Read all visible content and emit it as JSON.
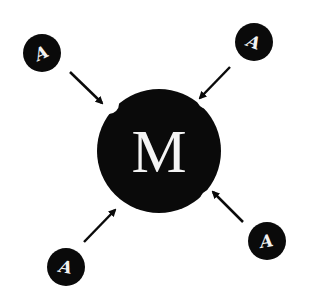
{
  "diagram": {
    "type": "hub-and-spoke",
    "colors": {
      "fill": "#0a0a0a",
      "text": "#f4f4f4",
      "background": "#ffffff"
    },
    "center": {
      "label": "M",
      "cx": 159,
      "cy": 151,
      "r": 62
    },
    "satellites": [
      {
        "id": "top-left",
        "label": "A",
        "cx": 42,
        "cy": 53,
        "rotate": -25
      },
      {
        "id": "top-right",
        "label": "A",
        "cx": 254,
        "cy": 42,
        "rotate": 20
      },
      {
        "id": "bottom-left",
        "label": "A",
        "cx": 66,
        "cy": 267,
        "rotate": 10
      },
      {
        "id": "bottom-right",
        "label": "A",
        "cx": 267,
        "cy": 241,
        "rotate": -10
      }
    ],
    "arrows": [
      {
        "from": "top-left",
        "to": "center",
        "x1": 70,
        "y1": 72,
        "x2": 102,
        "y2": 103
      },
      {
        "from": "top-right",
        "to": "center",
        "x1": 230,
        "y1": 67,
        "x2": 200,
        "y2": 98
      },
      {
        "from": "bottom-left",
        "to": "center",
        "x1": 84,
        "y1": 242,
        "x2": 115,
        "y2": 210
      },
      {
        "from": "bottom-right",
        "to": "center",
        "x1": 243,
        "y1": 222,
        "x2": 213,
        "y2": 192
      }
    ]
  }
}
